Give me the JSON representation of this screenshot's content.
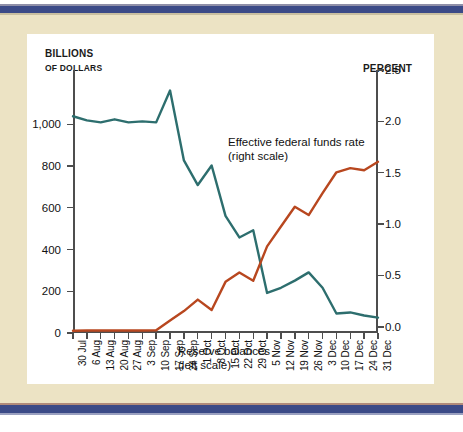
{
  "page": {
    "background_color": "#ece3c4",
    "panel_color": "#ffffff",
    "rule_color": "#3b4a87"
  },
  "axes": {
    "left_title_line1": "BILLIONS",
    "left_title_line2": "OF DOLLARS",
    "right_title": "PERCENT",
    "left_ticks": [
      "1,000",
      "800",
      "600",
      "400",
      "200",
      "0"
    ],
    "right_ticks": [
      "2.5",
      "2.0",
      "1.5",
      "1.0",
      "0.5",
      "0.0"
    ]
  },
  "annotations": {
    "ffr_line1": "Effective federal funds rate",
    "ffr_line2": "(right scale)",
    "reserves_line1": "Reserve balances",
    "reserves_line2": "(left scale)"
  },
  "chart_data": {
    "type": "line",
    "title": "",
    "xlabel": "",
    "grid": false,
    "legend_position": "inline-annotations",
    "categories": [
      "30 Jul",
      "6 Aug",
      "13 Aug",
      "20 Aug",
      "27 Aug",
      "3 Sep",
      "10 Sep",
      "17 Sep",
      "24 Sep",
      "1 Oct",
      "8 Oct",
      "15 Oct",
      "22 Oct",
      "29 Oct",
      "5 Nov",
      "12 Nov",
      "19 Nov",
      "26 Nov",
      "3 Dec",
      "10 Dec",
      "17 Dec",
      "24 Dec",
      "31 Dec"
    ],
    "axes": {
      "left": {
        "label": "BILLIONS OF DOLLARS",
        "ylim": [
          0,
          1260
        ],
        "ticks": [
          0,
          200,
          400,
          600,
          800,
          1000
        ],
        "tick_labels": [
          "0",
          "200",
          "400",
          "600",
          "800",
          "1,000"
        ]
      },
      "right": {
        "label": "PERCENT",
        "ylim": [
          -0.06,
          2.5
        ],
        "ticks": [
          0.0,
          0.5,
          1.0,
          1.5,
          2.0,
          2.5
        ],
        "tick_labels": [
          "0.0",
          "0.5",
          "1.0",
          "1.5",
          "2.0",
          "2.5"
        ]
      }
    },
    "series": [
      {
        "name": "Effective federal funds rate",
        "axis": "right",
        "color": "#2d6e6e",
        "unit": "percent",
        "values": [
          2.05,
          2.01,
          1.99,
          2.02,
          1.99,
          2.0,
          1.99,
          2.3,
          1.62,
          1.38,
          1.57,
          1.08,
          0.87,
          0.94,
          0.33,
          0.38,
          0.45,
          0.53,
          0.38,
          0.13,
          0.14,
          0.11,
          0.09
        ]
      },
      {
        "name": "Reserve balances",
        "axis": "left",
        "color": "#b8471f",
        "unit": "billions of dollars",
        "values": [
          11,
          12,
          12,
          12,
          12,
          12,
          13,
          60,
          105,
          160,
          110,
          245,
          290,
          250,
          415,
          510,
          605,
          565,
          670,
          770,
          790,
          780,
          820
        ]
      }
    ]
  }
}
